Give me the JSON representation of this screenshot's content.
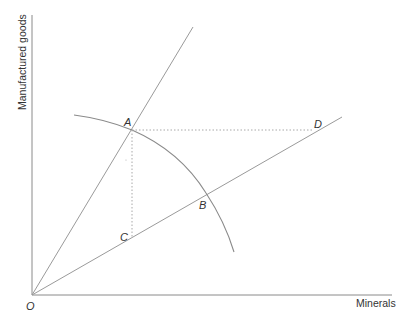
{
  "diagram": {
    "type": "economics-production-possibility-diagram",
    "axes": {
      "y_label": "Manufactured goods",
      "x_label": "Minerals",
      "origin_label": "O"
    },
    "points": {
      "A": "A",
      "B": "B",
      "C": "C",
      "D": "D"
    },
    "elements": [
      {
        "name": "steep-ray",
        "from": "O",
        "through": "A"
      },
      {
        "name": "shallow-ray",
        "from": "O",
        "through": [
          "C",
          "B",
          "D"
        ]
      },
      {
        "name": "production-frontier-curve",
        "through": [
          "A",
          "B"
        ]
      },
      {
        "name": "guide-horizontal",
        "from": "A",
        "to": "D",
        "style": "dotted"
      },
      {
        "name": "guide-vertical",
        "from": "A",
        "to": "C",
        "style": "dotted"
      }
    ],
    "colors": {
      "line": "#8a8a8a",
      "text": "#333333",
      "background": "#ffffff"
    }
  }
}
